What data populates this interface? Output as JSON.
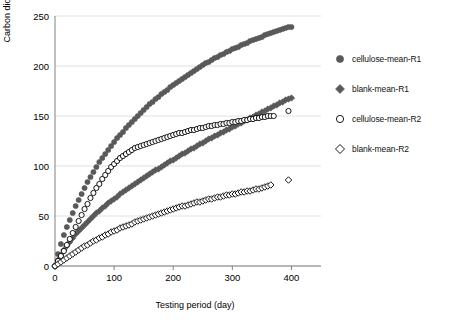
{
  "chart_data": {
    "type": "scatter",
    "title": "",
    "xlabel": "Testing period (day)",
    "ylabel": "Carbon dioxide evolved (mg)",
    "xlim": [
      0,
      450
    ],
    "ylim": [
      0,
      250
    ],
    "xticks": [
      "0",
      "100",
      "200",
      "300",
      "400"
    ],
    "yticks": [
      "0",
      "50",
      "100",
      "150",
      "200",
      "250"
    ],
    "grid": "horizontal",
    "legend_position": "right",
    "series": [
      {
        "name": "cellulose-mean-R1",
        "marker": "filled-circle",
        "color": "#595959",
        "points": [
          [
            0,
            0
          ],
          [
            5,
            12
          ],
          [
            10,
            22
          ],
          [
            15,
            31
          ],
          [
            20,
            39
          ],
          [
            25,
            46
          ],
          [
            30,
            53
          ],
          [
            35,
            60
          ],
          [
            40,
            66
          ],
          [
            45,
            72
          ],
          [
            50,
            78
          ],
          [
            55,
            84
          ],
          [
            60,
            89
          ],
          [
            65,
            94
          ],
          [
            70,
            99
          ],
          [
            75,
            104
          ],
          [
            80,
            108
          ],
          [
            85,
            112
          ],
          [
            90,
            116
          ],
          [
            95,
            120
          ],
          [
            100,
            124
          ],
          [
            105,
            128
          ],
          [
            110,
            131
          ],
          [
            115,
            134
          ],
          [
            120,
            138
          ],
          [
            125,
            141
          ],
          [
            130,
            144
          ],
          [
            135,
            147
          ],
          [
            140,
            150
          ],
          [
            145,
            153
          ],
          [
            150,
            156
          ],
          [
            155,
            159
          ],
          [
            160,
            162
          ],
          [
            165,
            164
          ],
          [
            170,
            167
          ],
          [
            175,
            169
          ],
          [
            180,
            172
          ],
          [
            185,
            174
          ],
          [
            190,
            176
          ],
          [
            195,
            179
          ],
          [
            200,
            181
          ],
          [
            205,
            183
          ],
          [
            210,
            185
          ],
          [
            215,
            187
          ],
          [
            220,
            189
          ],
          [
            225,
            191
          ],
          [
            230,
            193
          ],
          [
            235,
            195
          ],
          [
            240,
            197
          ],
          [
            245,
            199
          ],
          [
            250,
            201
          ],
          [
            255,
            203
          ],
          [
            260,
            204
          ],
          [
            265,
            206
          ],
          [
            270,
            208
          ],
          [
            275,
            209
          ],
          [
            280,
            211
          ],
          [
            285,
            212
          ],
          [
            290,
            214
          ],
          [
            295,
            215
          ],
          [
            300,
            217
          ],
          [
            305,
            218
          ],
          [
            310,
            219
          ],
          [
            315,
            221
          ],
          [
            320,
            222
          ],
          [
            325,
            223
          ],
          [
            330,
            225
          ],
          [
            335,
            226
          ],
          [
            340,
            227
          ],
          [
            345,
            228
          ],
          [
            350,
            229
          ],
          [
            355,
            231
          ],
          [
            360,
            232
          ],
          [
            365,
            233
          ],
          [
            370,
            234
          ],
          [
            375,
            235
          ],
          [
            380,
            236
          ],
          [
            385,
            237
          ],
          [
            390,
            238
          ],
          [
            395,
            239
          ],
          [
            400,
            239
          ]
        ]
      },
      {
        "name": "blank-mean-R1",
        "marker": "filled-diamond",
        "color": "#595959",
        "points": [
          [
            0,
            0
          ],
          [
            5,
            6
          ],
          [
            10,
            11
          ],
          [
            15,
            16
          ],
          [
            20,
            20
          ],
          [
            25,
            24
          ],
          [
            30,
            28
          ],
          [
            35,
            32
          ],
          [
            40,
            35
          ],
          [
            45,
            38
          ],
          [
            50,
            41
          ],
          [
            55,
            44
          ],
          [
            60,
            47
          ],
          [
            65,
            50
          ],
          [
            70,
            53
          ],
          [
            75,
            55
          ],
          [
            80,
            58
          ],
          [
            85,
            60
          ],
          [
            90,
            63
          ],
          [
            95,
            65
          ],
          [
            100,
            67
          ],
          [
            105,
            69
          ],
          [
            110,
            72
          ],
          [
            115,
            74
          ],
          [
            120,
            76
          ],
          [
            125,
            78
          ],
          [
            130,
            80
          ],
          [
            135,
            82
          ],
          [
            140,
            84
          ],
          [
            145,
            86
          ],
          [
            150,
            88
          ],
          [
            155,
            90
          ],
          [
            160,
            92
          ],
          [
            165,
            94
          ],
          [
            170,
            96
          ],
          [
            175,
            97
          ],
          [
            180,
            99
          ],
          [
            185,
            101
          ],
          [
            190,
            103
          ],
          [
            195,
            105
          ],
          [
            200,
            106
          ],
          [
            205,
            108
          ],
          [
            210,
            110
          ],
          [
            215,
            112
          ],
          [
            220,
            113
          ],
          [
            225,
            115
          ],
          [
            230,
            117
          ],
          [
            235,
            118
          ],
          [
            240,
            120
          ],
          [
            245,
            122
          ],
          [
            250,
            123
          ],
          [
            255,
            125
          ],
          [
            260,
            127
          ],
          [
            265,
            128
          ],
          [
            270,
            130
          ],
          [
            275,
            131
          ],
          [
            280,
            133
          ],
          [
            285,
            134
          ],
          [
            290,
            136
          ],
          [
            295,
            137
          ],
          [
            300,
            139
          ],
          [
            305,
            140
          ],
          [
            310,
            142
          ],
          [
            315,
            143
          ],
          [
            320,
            145
          ],
          [
            325,
            146
          ],
          [
            330,
            148
          ],
          [
            335,
            149
          ],
          [
            340,
            151
          ],
          [
            345,
            152
          ],
          [
            350,
            154
          ],
          [
            355,
            155
          ],
          [
            360,
            157
          ],
          [
            365,
            158
          ],
          [
            370,
            160
          ],
          [
            375,
            161
          ],
          [
            380,
            163
          ],
          [
            385,
            164
          ],
          [
            390,
            166
          ],
          [
            395,
            167
          ],
          [
            400,
            168
          ]
        ]
      },
      {
        "name": "cellulose-mean-R2",
        "marker": "open-circle",
        "color": "#000000",
        "points": [
          [
            0,
            0
          ],
          [
            5,
            5
          ],
          [
            10,
            10
          ],
          [
            15,
            15
          ],
          [
            20,
            21
          ],
          [
            25,
            27
          ],
          [
            30,
            33
          ],
          [
            35,
            39
          ],
          [
            40,
            45
          ],
          [
            45,
            51
          ],
          [
            50,
            57
          ],
          [
            55,
            62
          ],
          [
            60,
            68
          ],
          [
            65,
            73
          ],
          [
            70,
            78
          ],
          [
            75,
            82
          ],
          [
            80,
            87
          ],
          [
            85,
            91
          ],
          [
            90,
            95
          ],
          [
            95,
            99
          ],
          [
            100,
            102
          ],
          [
            105,
            105
          ],
          [
            110,
            108
          ],
          [
            115,
            110
          ],
          [
            120,
            112
          ],
          [
            125,
            114
          ],
          [
            130,
            116
          ],
          [
            135,
            118
          ],
          [
            140,
            119
          ],
          [
            145,
            120
          ],
          [
            150,
            121
          ],
          [
            155,
            122
          ],
          [
            160,
            123
          ],
          [
            165,
            124
          ],
          [
            170,
            125
          ],
          [
            175,
            126
          ],
          [
            180,
            127
          ],
          [
            185,
            128
          ],
          [
            190,
            129
          ],
          [
            195,
            130
          ],
          [
            200,
            131
          ],
          [
            205,
            132
          ],
          [
            210,
            133
          ],
          [
            215,
            133
          ],
          [
            220,
            134
          ],
          [
            225,
            135
          ],
          [
            230,
            136
          ],
          [
            235,
            136
          ],
          [
            240,
            137
          ],
          [
            245,
            138
          ],
          [
            250,
            138
          ],
          [
            255,
            139
          ],
          [
            260,
            140
          ],
          [
            265,
            140
          ],
          [
            270,
            141
          ],
          [
            275,
            141
          ],
          [
            280,
            142
          ],
          [
            285,
            142
          ],
          [
            290,
            143
          ],
          [
            295,
            143
          ],
          [
            300,
            144
          ],
          [
            305,
            144
          ],
          [
            310,
            145
          ],
          [
            315,
            145
          ],
          [
            320,
            146
          ],
          [
            325,
            146
          ],
          [
            330,
            147
          ],
          [
            335,
            147
          ],
          [
            340,
            148
          ],
          [
            345,
            148
          ],
          [
            350,
            149
          ],
          [
            355,
            149
          ],
          [
            360,
            150
          ],
          [
            365,
            150
          ],
          [
            370,
            150
          ],
          [
            395,
            155
          ]
        ]
      },
      {
        "name": "blank-mean-R2",
        "marker": "open-diamond",
        "color": "#000000",
        "points": [
          [
            0,
            0
          ],
          [
            5,
            2
          ],
          [
            10,
            4
          ],
          [
            15,
            6
          ],
          [
            20,
            8
          ],
          [
            25,
            10
          ],
          [
            30,
            12
          ],
          [
            35,
            14
          ],
          [
            40,
            16
          ],
          [
            45,
            18
          ],
          [
            50,
            20
          ],
          [
            55,
            21
          ],
          [
            60,
            23
          ],
          [
            65,
            25
          ],
          [
            70,
            26
          ],
          [
            75,
            28
          ],
          [
            80,
            29
          ],
          [
            85,
            31
          ],
          [
            90,
            32
          ],
          [
            95,
            34
          ],
          [
            100,
            35
          ],
          [
            105,
            36
          ],
          [
            110,
            38
          ],
          [
            115,
            39
          ],
          [
            120,
            40
          ],
          [
            125,
            41
          ],
          [
            130,
            42
          ],
          [
            135,
            44
          ],
          [
            140,
            45
          ],
          [
            145,
            46
          ],
          [
            150,
            47
          ],
          [
            155,
            48
          ],
          [
            160,
            49
          ],
          [
            165,
            50
          ],
          [
            170,
            51
          ],
          [
            175,
            52
          ],
          [
            180,
            53
          ],
          [
            185,
            54
          ],
          [
            190,
            55
          ],
          [
            195,
            56
          ],
          [
            200,
            57
          ],
          [
            205,
            58
          ],
          [
            210,
            59
          ],
          [
            215,
            60
          ],
          [
            220,
            60
          ],
          [
            225,
            61
          ],
          [
            230,
            62
          ],
          [
            235,
            63
          ],
          [
            240,
            64
          ],
          [
            245,
            64
          ],
          [
            250,
            65
          ],
          [
            255,
            66
          ],
          [
            260,
            67
          ],
          [
            265,
            67
          ],
          [
            270,
            68
          ],
          [
            275,
            69
          ],
          [
            280,
            69
          ],
          [
            285,
            70
          ],
          [
            290,
            71
          ],
          [
            295,
            71
          ],
          [
            300,
            72
          ],
          [
            305,
            72
          ],
          [
            310,
            73
          ],
          [
            315,
            74
          ],
          [
            320,
            74
          ],
          [
            325,
            75
          ],
          [
            330,
            75
          ],
          [
            335,
            76
          ],
          [
            340,
            77
          ],
          [
            345,
            77
          ],
          [
            350,
            78
          ],
          [
            355,
            79
          ],
          [
            360,
            80
          ],
          [
            365,
            81
          ],
          [
            395,
            86
          ]
        ]
      }
    ]
  },
  "legend": {
    "items": [
      {
        "label": "cellulose-mean-R1",
        "marker": "filled-circle"
      },
      {
        "label": "blank-mean-R1",
        "marker": "filled-diamond"
      },
      {
        "label": "cellulose-mean-R2",
        "marker": "open-circle"
      },
      {
        "label": "blank-mean-R2",
        "marker": "open-diamond"
      }
    ]
  }
}
